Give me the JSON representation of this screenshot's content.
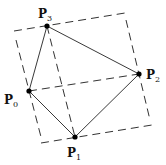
{
  "diagram": {
    "colors": {
      "line": "#222222",
      "dashed": "#333333",
      "point": "#000000",
      "background": "#ffffff"
    },
    "points": [
      {
        "id": "P0",
        "letter": "P",
        "sub": "0",
        "x": 29,
        "y": 91,
        "label_x": 4,
        "label_y": 104
      },
      {
        "id": "P1",
        "letter": "P",
        "sub": "1",
        "x": 75,
        "y": 137,
        "label_x": 67,
        "label_y": 157
      },
      {
        "id": "P2",
        "letter": "P",
        "sub": "2",
        "x": 139,
        "y": 74,
        "label_x": 146,
        "label_y": 79
      },
      {
        "id": "P3",
        "letter": "P",
        "sub": "3",
        "x": 47,
        "y": 26,
        "label_x": 38,
        "label_y": 18
      }
    ],
    "solid_edges": [
      [
        "P0",
        "P3"
      ],
      [
        "P3",
        "P2"
      ],
      [
        "P2",
        "P1"
      ],
      [
        "P1",
        "P0"
      ]
    ],
    "dashed_diagonals": [
      [
        "P0",
        "P2"
      ],
      [
        "P3",
        "P1"
      ]
    ],
    "bounding_rectangle_dashed": [
      {
        "name": "top",
        "x1": 14,
        "y1": 31,
        "x2": 125,
        "y2": 13
      },
      {
        "name": "right",
        "x1": 126,
        "y1": 20,
        "x2": 150,
        "y2": 120
      },
      {
        "name": "bottom",
        "x1": 41,
        "y1": 143,
        "x2": 152,
        "y2": 125
      },
      {
        "name": "left",
        "x1": 16,
        "y1": 40,
        "x2": 41,
        "y2": 137
      }
    ]
  }
}
